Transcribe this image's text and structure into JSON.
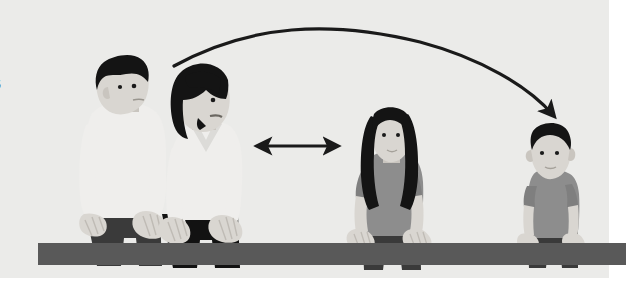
{
  "figure": {
    "caption_fragment": "5",
    "background_color": "#ebebe9",
    "page_color": "#ffffff",
    "panel": {
      "x": 0,
      "y": 0,
      "width": 609,
      "height": 278
    }
  },
  "palette": {
    "hair_dark": "#141414",
    "skin_light": "#d9d6d1",
    "skin_shadow": "#c9c5bf",
    "shirt_white": "#efeeec",
    "shirt_gray": "#8d8d8d",
    "shirt_gray_dark": "#7f7f7f",
    "trousers_dark": "#3a3a3a",
    "trousers_black": "#121212",
    "bench_gray": "#595959",
    "arrow_black": "#1a1a1a",
    "outline": "#9a9a9a"
  },
  "bench": {
    "label": "bench-bar",
    "x": 38,
    "y": 243,
    "width": 588,
    "height": 22,
    "color": "#595959"
  },
  "people": [
    {
      "id": "father",
      "label": "Adult man",
      "role": "father",
      "seat_order": 1,
      "hair": "short dark hair",
      "top": "white short-sleeve shirt",
      "bottom": "dark trousers",
      "facing": "right",
      "center_x": 120
    },
    {
      "id": "mother",
      "label": "Adult woman",
      "role": "mother",
      "seat_order": 2,
      "hair": "dark bob cut",
      "top": "white v-neck top",
      "bottom": "black trousers",
      "facing": "right",
      "center_x": 205
    },
    {
      "id": "daughter",
      "label": "Girl",
      "role": "older child",
      "seat_order": 3,
      "hair": "long dark hair",
      "top": "gray t-shirt",
      "bottom": "dark shorts",
      "facing": "front",
      "center_x": 390
    },
    {
      "id": "toddler",
      "label": "Young child",
      "role": "toddler",
      "seat_order": 4,
      "hair": "short dark hair",
      "top": "gray t-shirt",
      "bottom": "dark shorts",
      "facing": "front",
      "center_x": 552
    }
  ],
  "annotations": [
    {
      "id": "curved-arrow",
      "type": "curved-arrow",
      "style": "single-headed arc",
      "from": "mother",
      "to": "toddler",
      "start": {
        "x": 174,
        "y": 66
      },
      "end": {
        "x": 557,
        "y": 121
      },
      "apex": {
        "x": 360,
        "y": 33
      },
      "color": "#1a1a1a"
    },
    {
      "id": "distance-arrow",
      "type": "double-headed-arrow",
      "style": "horizontal two-way",
      "from": "mother",
      "to": "daughter",
      "start": {
        "x": 255,
        "y": 146
      },
      "end": {
        "x": 340,
        "y": 146
      },
      "color": "#1a1a1a"
    }
  ]
}
